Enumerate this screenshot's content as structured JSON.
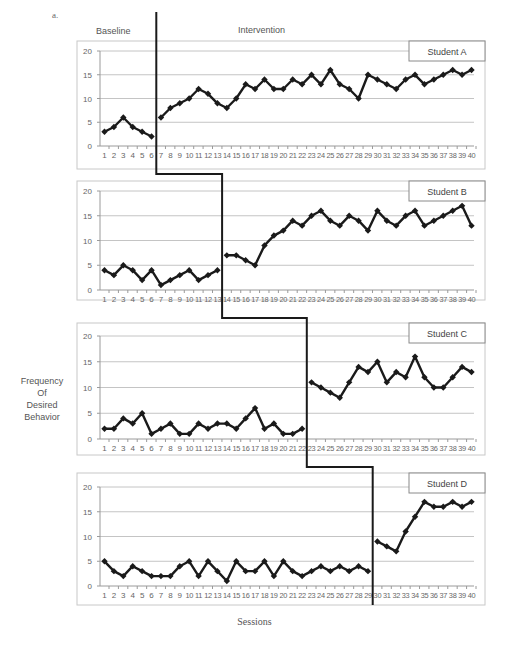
{
  "figure": {
    "label": "a.",
    "phase_labels": [
      "Baseline",
      "Intervention"
    ],
    "ylabel_lines": [
      "Frequency",
      "Of",
      "Desired",
      "Behavior"
    ],
    "xlabel": "Sessions"
  },
  "chart_data": {
    "type": "line",
    "layout": "multiple-baseline (4 stacked panels)",
    "xlabel": "Sessions",
    "ylabel": "Frequency Of Desired Behavior",
    "x": [
      1,
      2,
      3,
      4,
      5,
      6,
      7,
      8,
      9,
      10,
      11,
      12,
      13,
      14,
      15,
      16,
      17,
      18,
      19,
      20,
      21,
      22,
      23,
      24,
      25,
      26,
      27,
      28,
      29,
      30,
      31,
      32,
      33,
      34,
      35,
      36,
      37,
      38,
      39,
      40
    ],
    "ylim": [
      0,
      20
    ],
    "yticks": [
      0,
      5,
      10,
      15,
      20
    ],
    "grid": true,
    "phases": [
      "Baseline",
      "Intervention"
    ],
    "panels": [
      {
        "name": "Student A",
        "phase_change_after_session": 6,
        "values": [
          3,
          4,
          6,
          4,
          3,
          2,
          6,
          8,
          9,
          10,
          12,
          11,
          9,
          8,
          10,
          13,
          12,
          14,
          12,
          12,
          14,
          13,
          15,
          13,
          16,
          13,
          12,
          10,
          15,
          14,
          13,
          12,
          14,
          15,
          13,
          14,
          15,
          16,
          15,
          16
        ]
      },
      {
        "name": "Student B",
        "phase_change_after_session": 13,
        "values": [
          4,
          3,
          5,
          4,
          2,
          4,
          1,
          2,
          3,
          4,
          2,
          3,
          4,
          7,
          7,
          6,
          5,
          9,
          11,
          12,
          14,
          13,
          15,
          16,
          14,
          13,
          15,
          14,
          12,
          16,
          14,
          13,
          15,
          16,
          13,
          14,
          15,
          16,
          17,
          13
        ]
      },
      {
        "name": "Student C",
        "phase_change_after_session": 22,
        "values": [
          2,
          2,
          4,
          3,
          5,
          1,
          2,
          3,
          1,
          1,
          3,
          2,
          3,
          3,
          2,
          4,
          6,
          2,
          3,
          1,
          1,
          2,
          11,
          10,
          9,
          8,
          11,
          14,
          13,
          15,
          11,
          13,
          12,
          16,
          12,
          10,
          10,
          12,
          14,
          13
        ]
      },
      {
        "name": "Student D",
        "phase_change_after_session": 29,
        "values": [
          5,
          3,
          2,
          4,
          3,
          2,
          2,
          2,
          4,
          5,
          2,
          5,
          3,
          1,
          5,
          3,
          3,
          5,
          2,
          5,
          3,
          2,
          3,
          4,
          3,
          4,
          3,
          4,
          3,
          9,
          8,
          7,
          11,
          14,
          17,
          16,
          16,
          17,
          16,
          17
        ]
      }
    ]
  }
}
